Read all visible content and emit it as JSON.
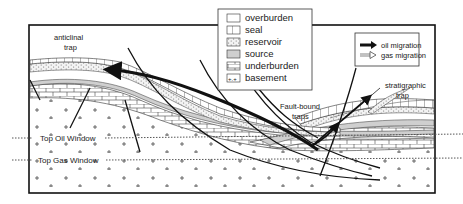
{
  "diagram": {
    "labels": {
      "anticlinal_trap": [
        "anticlinal",
        "trap"
      ],
      "fault_bound_traps": [
        "Fault-bound",
        "traps"
      ],
      "stratigraphic_trap": [
        "stratigraphic",
        "trap"
      ],
      "top_oil_window": "Top Oil Window",
      "top_gas_window": "Top Gas Window"
    },
    "legend_layers": [
      {
        "key": "overburden",
        "label": "overburden",
        "pattern": "blank"
      },
      {
        "key": "seal",
        "label": "seal",
        "pattern": "vertical-bars"
      },
      {
        "key": "reservoir",
        "label": "reservoir",
        "pattern": "dotted"
      },
      {
        "key": "source",
        "label": "source",
        "pattern": "grey-fill"
      },
      {
        "key": "underburden",
        "label": "underburden",
        "pattern": "brick"
      },
      {
        "key": "basement",
        "label": "basement",
        "pattern": "plus-signs"
      }
    ],
    "legend_migration": [
      {
        "key": "oil",
        "label": "oil migration",
        "arrow": "solid-black"
      },
      {
        "key": "gas",
        "label": "gas migration",
        "arrow": "hollow"
      }
    ],
    "colors": {
      "line": "#1a1a1a",
      "source_fill": "#cfcfcf",
      "frame": "#111111",
      "background": "#ffffff"
    }
  }
}
